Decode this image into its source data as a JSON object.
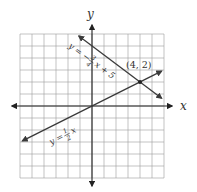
{
  "chart_data": {
    "type": "line",
    "title": "",
    "xlabel": "x",
    "ylabel": "y",
    "xlim": [
      -6,
      6
    ],
    "ylim": [
      -6,
      6
    ],
    "grid": true,
    "tick_labels": false,
    "series": [
      {
        "name": "y = -3/4 x + 5",
        "equation_label": "y = −¾x + 5",
        "slope": -0.75,
        "intercept": 5,
        "x_range": [
          -1.1,
          5.8
        ],
        "arrows": "both",
        "color": "#3a3a3a"
      },
      {
        "name": "y = 1/2 x",
        "equation_label": "y = ½x",
        "slope": 0.5,
        "intercept": 0,
        "x_range": [
          -5.8,
          5.8
        ],
        "arrows": "both",
        "color": "#3a3a3a"
      }
    ],
    "annotations": [
      {
        "text": "(4, 2)",
        "x": 4,
        "y": 2,
        "type": "intersection-point"
      }
    ]
  },
  "labels": {
    "x_axis": "x",
    "y_axis": "y",
    "line1_lhs": "y = −",
    "line1_num": "3",
    "line1_den": "4",
    "line1_rhs": "x + 5",
    "line2_lhs": "y =",
    "line2_num": "1",
    "line2_den": "2",
    "line2_rhs": "x",
    "point": "(4, 2)"
  }
}
